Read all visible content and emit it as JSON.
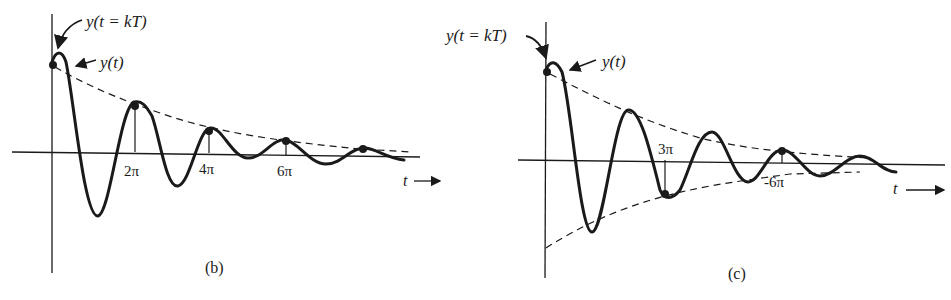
{
  "panels": [
    {
      "id": "b",
      "caption": "(b)",
      "sample_label": "y(t = kT)",
      "signal_label": "y(t)",
      "axis_label": "t",
      "ticks": [
        "2π",
        "4π",
        "6π"
      ],
      "description": "Damped oscillation sampled at t = 2πk; samples all positive, lying on a single decaying envelope"
    },
    {
      "id": "c",
      "caption": "(c)",
      "sample_label": "y(t = kT)",
      "signal_label": "y(t)",
      "axis_label": "t",
      "ticks": [
        "3π",
        "-6π"
      ],
      "description": "Damped oscillation sampled at t = 3πk; samples alternate sign between upper and lower decaying envelopes"
    }
  ],
  "colors": {
    "ink": "#1a1a1a",
    "paper": "#ffffff"
  }
}
